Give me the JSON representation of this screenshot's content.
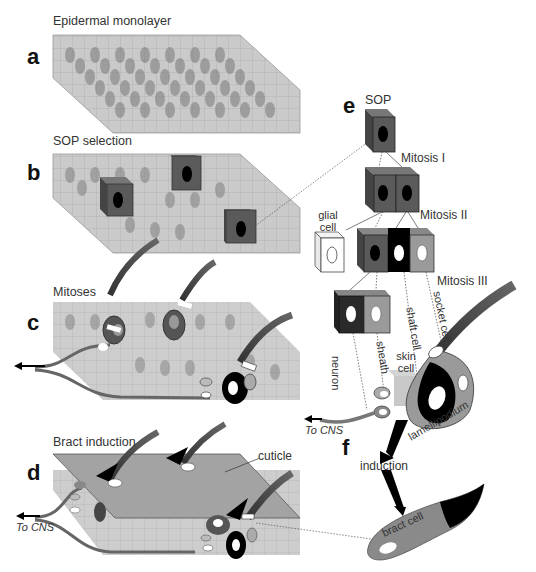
{
  "figure": {
    "panels": [
      {
        "letter": "a",
        "title": "Epidermal monolayer"
      },
      {
        "letter": "b",
        "title": "SOP selection"
      },
      {
        "letter": "c",
        "title": "Mitoses"
      },
      {
        "letter": "d",
        "title": "Bract induction"
      },
      {
        "letter": "e",
        "title": "SOP"
      },
      {
        "letter": "f",
        "title": "induction"
      }
    ],
    "lineage": {
      "mitosis_1": "Mitosis I",
      "mitosis_2": "Mitosis II",
      "mitosis_3": "Mitosis III",
      "glial_cell_line1": "glial",
      "glial_cell_line2": "cell",
      "neuron": "neuron",
      "sheath": "sheath",
      "shaft_cell": "shaft cell",
      "socket_cell": "socket cell",
      "skin_cell_line1": "skin",
      "skin_cell_line2": "cell",
      "lamellipodium": "lamellipodium",
      "to_cns": "To CNS"
    },
    "panel_d": {
      "cuticle": "cuticle",
      "to_cns": "To CNS"
    },
    "panel_f": {
      "induction": "induction",
      "bract_cell": "bract cell"
    },
    "colors": {
      "sop_gray": "#5a5a5a",
      "socket_gray": "#9a9a9a",
      "shaft_black": "#000000",
      "glial_white": "#ffffff",
      "epithelium": "#b9b9b9",
      "cuticle": "#a3a3a3"
    }
  }
}
